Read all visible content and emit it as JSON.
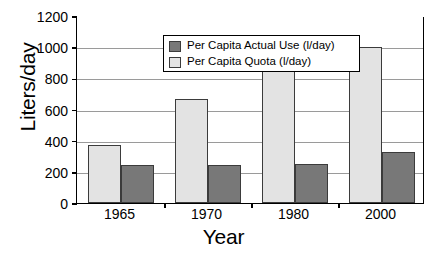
{
  "chart_data": {
    "type": "bar",
    "title": "",
    "xlabel": "Year",
    "ylabel": "Liters/day",
    "categories": [
      "1965",
      "1970",
      "1980",
      "2000"
    ],
    "series": [
      {
        "name": "Per Capita Actual Use (l/day)",
        "color": "#787878",
        "values": [
          245,
          245,
          250,
          325
        ]
      },
      {
        "name": "Per Capita Quota (l/day)",
        "color": "#e3e3e3",
        "values": [
          370,
          665,
          860,
          1000
        ]
      }
    ],
    "series_draw_order": [
      "Per Capita Quota (l/day)",
      "Per Capita Actual Use (l/day)"
    ],
    "ylim": [
      0,
      1200
    ],
    "ytick_values": [
      0,
      200,
      400,
      600,
      800,
      1000,
      1200
    ],
    "ytick_labels": [
      "0",
      "200",
      "400",
      "600",
      "800",
      "1000",
      "1200"
    ],
    "grid": "horizontal",
    "legend_position": "top-left-inside",
    "legend_entries": [
      "Per Capita Actual Use (l/day)",
      "Per Capita Quota (l/day)"
    ],
    "colors": {
      "actual_use": "#787878",
      "quota": "#e3e3e3",
      "bar_edge": "#3b3b3b",
      "gridline": "#9a9a9a",
      "axis": "#000000",
      "background": "#ffffff"
    }
  }
}
